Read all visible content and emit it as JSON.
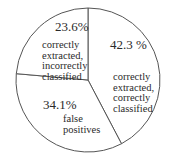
{
  "chart_data": {
    "type": "pie",
    "title": "",
    "start_angle_deg": 0,
    "direction": "clockwise",
    "slices": [
      {
        "label": "correctly extracted, correctly classified",
        "value": 42.3,
        "display": "42.3 %",
        "lines": [
          "correctly",
          "extracted,",
          "correctly",
          "classified"
        ]
      },
      {
        "label": "false positives",
        "value": 34.1,
        "display": "34.1%",
        "lines": [
          "false",
          "positives"
        ]
      },
      {
        "label": "correctly extracted, incorrectly classified",
        "value": 23.6,
        "display": "23.6%",
        "lines": [
          "correctly",
          "extracted,",
          "incorrectly",
          "classified"
        ]
      }
    ],
    "legend": null,
    "colors": {
      "fill": "#ffffff",
      "stroke": "#555555",
      "text": "#2a2a2a"
    }
  }
}
